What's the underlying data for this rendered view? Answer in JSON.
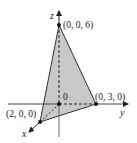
{
  "diagram": {
    "type": "3d-coordinate-plane-triangle",
    "axes": {
      "x_label": "x",
      "y_label": "y",
      "z_label": "z"
    },
    "origin_label": "0",
    "points": [
      {
        "id": "z-intercept",
        "label": "(0, 0, 6)"
      },
      {
        "id": "y-intercept",
        "label": "(0, 3, 0)"
      },
      {
        "id": "x-intercept",
        "label": "(2, 0, 0)"
      }
    ],
    "colors": {
      "fill": "#c8c8c8",
      "stroke": "#222222",
      "background": "#ffffff"
    }
  }
}
